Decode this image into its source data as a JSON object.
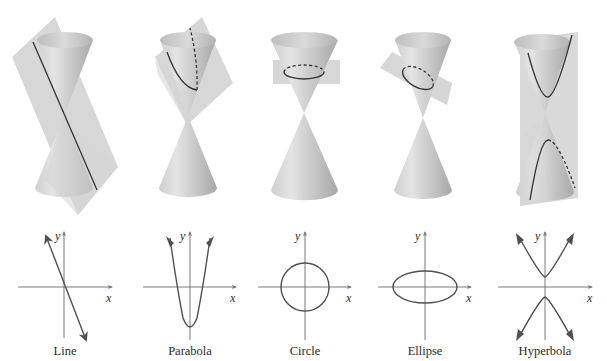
{
  "figure": {
    "colors": {
      "background": "#ffffff",
      "cone_light": "#e6e6e6",
      "cone_mid": "#c9c9c9",
      "cone_dark": "#a9a9a9",
      "plane": "#d2d2d2",
      "curve": "#3a3a3a",
      "axis": "#6a6a6a"
    },
    "panels": [
      {
        "id": "line",
        "label": "Line",
        "axis_x": "x",
        "axis_y": "y",
        "cx": 64
      },
      {
        "id": "parabola",
        "label": "Parabola",
        "axis_x": "x",
        "axis_y": "y",
        "cx": 190
      },
      {
        "id": "circle",
        "label": "Circle",
        "axis_x": "x",
        "axis_y": "y",
        "cx": 305
      },
      {
        "id": "ellipse",
        "label": "Ellipse",
        "axis_x": "x",
        "axis_y": "y",
        "cx": 425
      },
      {
        "id": "hyperbola",
        "label": "Hyperbola",
        "axis_x": "x",
        "axis_y": "y",
        "cx": 545
      }
    ]
  }
}
